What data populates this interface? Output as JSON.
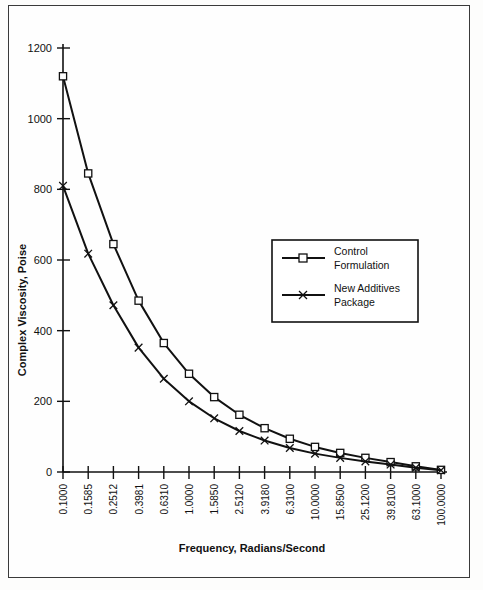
{
  "chart_data": {
    "type": "line",
    "title": "",
    "xlabel": "Frequency, Radians/Second",
    "ylabel": "Complex Viscosity, Poise",
    "categories": [
      "0.1000",
      "0.1585",
      "0.2512",
      "0.3981",
      "0.6310",
      "1.0000",
      "1.5850",
      "2.5120",
      "3.9180",
      "6.3100",
      "10.0000",
      "15.8500",
      "25.1200",
      "39.8100",
      "63.1000",
      "100.0000"
    ],
    "x_tick_labels": [
      "0.1000",
      "0.1585",
      "0.2512",
      "0.3981",
      "0.6310",
      "1.0000",
      "1.5850",
      "2.5120",
      "3.9180",
      "6.3100",
      "10.0000",
      "15.8500",
      "25.1200",
      "39.8100",
      "63.1000",
      "100.0000"
    ],
    "y_tick_labels": [
      "0",
      "200",
      "400",
      "600",
      "800",
      "1000",
      "1200"
    ],
    "y_ticks": [
      0,
      200,
      400,
      600,
      800,
      1000,
      1200
    ],
    "ylim": [
      0,
      1200
    ],
    "grid": false,
    "legend_position": "center-right",
    "series": [
      {
        "name": "Control Formulation",
        "marker": "square",
        "values": [
          1120,
          845,
          645,
          485,
          365,
          278,
          212,
          162,
          124,
          94,
          71,
          54,
          40,
          28,
          16,
          6
        ]
      },
      {
        "name": "New Additives Package",
        "marker": "x",
        "values": [
          810,
          618,
          472,
          352,
          264,
          200,
          152,
          116,
          89,
          68,
          52,
          40,
          30,
          21,
          12,
          5
        ]
      }
    ]
  },
  "legend": {
    "entries": [
      {
        "label_line1": "Control",
        "label_line2": "Formulation",
        "marker": "square"
      },
      {
        "label_line1": "New Additives",
        "label_line2": "Package",
        "marker": "x"
      }
    ]
  },
  "axes": {
    "y_title": "Complex Viscosity, Poise",
    "x_title": "Frequency, Radians/Second"
  }
}
